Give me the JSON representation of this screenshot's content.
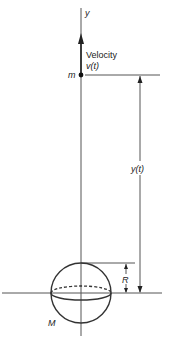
{
  "diagram": {
    "axis_label": "y",
    "velocity_label": "Velocity",
    "velocity_symbol": "v(t)",
    "mass_small_label": "m",
    "height_label": "y(t)",
    "radius_label": "R",
    "mass_large_label": "M",
    "stroke_color": "#333333",
    "background": "#ffffff"
  }
}
